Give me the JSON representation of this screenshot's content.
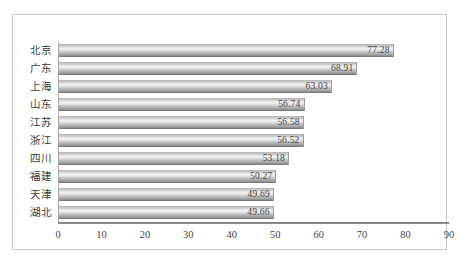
{
  "chart_data": {
    "type": "bar",
    "orientation": "horizontal",
    "title": "",
    "subtitle": "",
    "xlabel": "",
    "ylabel": "",
    "categories": [
      "北京",
      "广东",
      "上海",
      "山东",
      "江苏",
      "浙江",
      "四川",
      "福建",
      "天津",
      "湖北"
    ],
    "values": [
      77.28,
      68.91,
      63.03,
      56.74,
      56.58,
      56.52,
      53.18,
      50.27,
      49.69,
      49.66
    ],
    "value_labels": [
      "77.28",
      "68.91",
      "63.03",
      "56.74",
      "56.58",
      "56.52",
      "53.18",
      "50.27",
      "49.69",
      "49.66"
    ],
    "xlim": [
      0,
      90
    ],
    "xticks": [
      0,
      10,
      20,
      30,
      40,
      50,
      60,
      70,
      80,
      90
    ],
    "xtick_labels": [
      "0",
      "10",
      "20",
      "30",
      "40",
      "50",
      "60",
      "70",
      "80",
      "90"
    ],
    "grid": false,
    "legend": false,
    "legend_position": "none",
    "series": [
      {
        "name": "",
        "values": [
          77.28,
          68.91,
          63.03,
          56.74,
          56.58,
          56.52,
          53.18,
          50.27,
          49.69,
          49.66
        ]
      }
    ],
    "colors": {
      "bar_light": "#f2f2f2",
      "bar_mid": "#bdbdbd",
      "bar_dark": "#6e6e6e",
      "axis": "#6f6f6f",
      "text": "#3a3a3a",
      "border": "#c8c8c8",
      "background": "#ffffff"
    }
  }
}
